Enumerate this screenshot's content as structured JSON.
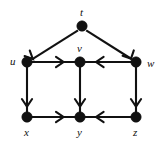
{
  "figure": {
    "width": 166,
    "height": 148,
    "background_color": "#ffffff",
    "ink_color": "#111111",
    "type": "directed-graph-diagram"
  },
  "graph": {
    "nodes": [
      {
        "id": "t",
        "label": "t",
        "cx": 82,
        "cy": 26,
        "r": 5.2,
        "label_x": 80,
        "label_y": 7,
        "label_pos": "above"
      },
      {
        "id": "u",
        "label": "u",
        "cx": 27,
        "cy": 62,
        "r": 5.2,
        "label_x": 10,
        "label_y": 56,
        "label_pos": "left"
      },
      {
        "id": "v",
        "label": "v",
        "cx": 80,
        "cy": 62,
        "r": 5.2,
        "label_x": 77,
        "label_y": 43,
        "label_pos": "above"
      },
      {
        "id": "w",
        "label": "w",
        "cx": 136,
        "cy": 62,
        "r": 5.2,
        "label_x": 147,
        "label_y": 58,
        "label_pos": "right"
      },
      {
        "id": "x",
        "label": "x",
        "cx": 27,
        "cy": 117,
        "r": 5.2,
        "label_x": 24,
        "label_y": 127,
        "label_pos": "below"
      },
      {
        "id": "y",
        "label": "y",
        "cx": 80,
        "cy": 117,
        "r": 5.2,
        "label_x": 77,
        "label_y": 127,
        "label_pos": "below"
      },
      {
        "id": "z",
        "label": "z",
        "cx": 136,
        "cy": 117,
        "r": 5.2,
        "label_x": 133,
        "label_y": 127,
        "label_pos": "below"
      }
    ],
    "edges": [
      {
        "from": "t",
        "to": "u",
        "direction": "down-left",
        "arrow_at": "u"
      },
      {
        "from": "t",
        "to": "w",
        "direction": "down-right",
        "arrow_at": "w"
      },
      {
        "from": "u",
        "to": "v",
        "direction": "right",
        "arrow_at": "v"
      },
      {
        "from": "w",
        "to": "v",
        "direction": "left",
        "arrow_at": "v"
      },
      {
        "from": "u",
        "to": "x",
        "direction": "down",
        "arrow_at": "x"
      },
      {
        "from": "v",
        "to": "y",
        "direction": "down",
        "arrow_at": "y"
      },
      {
        "from": "w",
        "to": "z",
        "direction": "down",
        "arrow_at": "z"
      },
      {
        "from": "x",
        "to": "y",
        "direction": "right",
        "arrow_at": "y"
      },
      {
        "from": "z",
        "to": "y",
        "direction": "left",
        "arrow_at": "y"
      }
    ]
  }
}
